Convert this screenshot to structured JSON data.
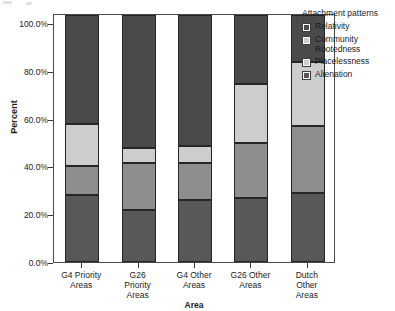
{
  "chart_data": {
    "type": "bar",
    "subtype": "stacked-percent",
    "title": "",
    "xlabel": "Area",
    "ylabel": "Percent",
    "ylim": [
      0,
      100
    ],
    "yticks": [
      "0.0%",
      "20.0%",
      "40.0%",
      "60.0%",
      "80.0%",
      "100.0%"
    ],
    "ytick_values": [
      0,
      20,
      40,
      60,
      80,
      100
    ],
    "grid": false,
    "legend_position": "right",
    "legend_title": "Attachment patterns",
    "categories": [
      "G4 Priority Areas",
      "G26 Priority Areas",
      "G4 Other Areas",
      "G26 Other Areas",
      "Dutch Other Areas"
    ],
    "category_lines": [
      [
        "G4 Priority",
        "Areas"
      ],
      [
        "G26",
        "Priority",
        "Areas"
      ],
      [
        "G4 Other",
        "Areas"
      ],
      [
        "G26 Other",
        "Areas"
      ],
      [
        "Dutch",
        "Other",
        "Areas"
      ]
    ],
    "stack_order_bottom_up": [
      "Alienation",
      "Placelessness",
      "Community Rootedness",
      "Relativity"
    ],
    "series": [
      {
        "name": "Alienation",
        "color": "#585858",
        "values": [
          27,
          21,
          25,
          26,
          28
        ]
      },
      {
        "name": "Placelessness",
        "color": "#8e8e8e",
        "values": [
          12,
          19,
          15,
          22,
          27
        ]
      },
      {
        "name": "Community Rootedness",
        "color": "#cdcdcd",
        "values": [
          17,
          6,
          7,
          24,
          26
        ]
      },
      {
        "name": "Relativity",
        "color": "#4a4a4a",
        "values": [
          44,
          54,
          53,
          28,
          19
        ]
      }
    ],
    "cumulative_tops": {
      "Alienation": [
        27,
        21,
        25,
        26,
        28
      ],
      "Placelessness": [
        39,
        40,
        40,
        48,
        55
      ],
      "Community Rootedness": [
        56,
        46,
        47,
        72,
        81
      ],
      "Relativity": [
        100,
        100,
        100,
        100,
        100
      ]
    }
  },
  "legend": {
    "title": "Attachment patterns",
    "items": [
      {
        "label": "Relativity",
        "color": "#4a4a4a"
      },
      {
        "label": "Community Rootedness",
        "color": "#cdcdcd"
      },
      {
        "label": "Placelessness",
        "color": "#cdcdcd"
      },
      {
        "label": "Alienation",
        "color": "#585858"
      }
    ],
    "item_lines": [
      [
        "Relativity"
      ],
      [
        "Community",
        "Rootedness"
      ],
      [
        "Placelessness"
      ],
      [
        "Alienation"
      ]
    ]
  },
  "axes": {
    "y_title": "Percent",
    "x_title": "Area"
  }
}
